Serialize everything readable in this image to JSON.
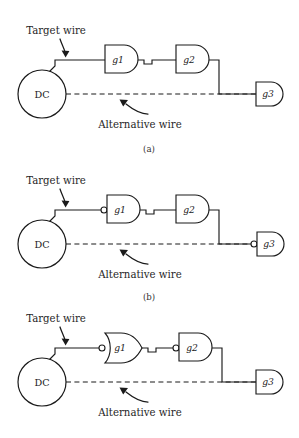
{
  "figure": {
    "background_color": "#ffffff",
    "line_color": "#1a1a1a",
    "panel_count": 3
  },
  "labels": {
    "target_wire": "Target wire",
    "alternative_wire": "Alternative wire",
    "dc": "DC",
    "gate_g1": "g1",
    "gate_g2": "g2",
    "gate_g3": "g3",
    "caption_a": "(a)",
    "caption_b": "(b)",
    "caption_c": "(c)"
  },
  "panels": [
    {
      "id": "a",
      "caption": "(a)",
      "source_label": "DC",
      "annotations": {
        "top": "Target wire",
        "bottom": "Alternative wire"
      },
      "gates": [
        {
          "name": "g1",
          "type": "and",
          "input_bubble": false
        },
        {
          "name": "g2",
          "type": "and",
          "input_bubble": false
        },
        {
          "name": "g3",
          "type": "and",
          "input_bubble": false
        }
      ]
    },
    {
      "id": "b",
      "caption": "(b)",
      "source_label": "DC",
      "annotations": {
        "top": "Target wire",
        "bottom": "Alternative wire"
      },
      "gates": [
        {
          "name": "g1",
          "type": "and",
          "input_bubble": true
        },
        {
          "name": "g2",
          "type": "and",
          "input_bubble": false
        },
        {
          "name": "g3",
          "type": "and",
          "input_bubble": true
        }
      ]
    },
    {
      "id": "c",
      "caption": "(c)",
      "source_label": "DC",
      "annotations": {
        "top": "Target wire",
        "bottom": "Alternative wire"
      },
      "gates": [
        {
          "name": "g1",
          "type": "or",
          "input_bubble": true
        },
        {
          "name": "g2",
          "type": "and",
          "input_bubble": true
        },
        {
          "name": "g3",
          "type": "and",
          "input_bubble": false
        }
      ]
    }
  ]
}
